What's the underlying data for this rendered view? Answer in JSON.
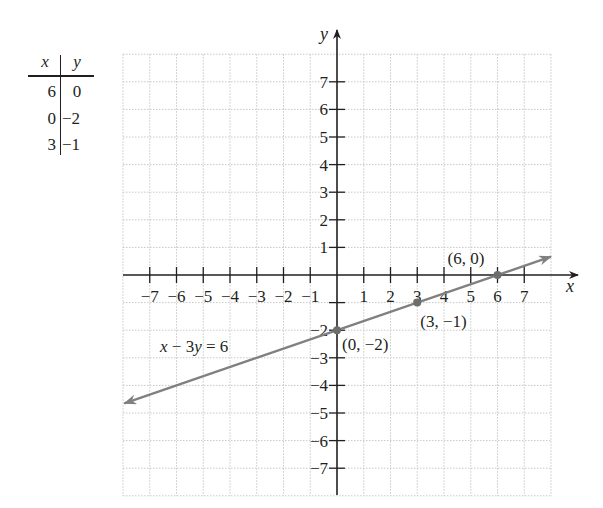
{
  "table": {
    "headers": [
      "x",
      "y"
    ],
    "rows": [
      [
        "6",
        "0"
      ],
      [
        "0",
        "−2"
      ],
      [
        "3",
        "−1"
      ]
    ]
  },
  "chart_data": {
    "type": "line",
    "title": "",
    "xlabel": "x",
    "ylabel": "y",
    "xlim": [
      -8,
      8
    ],
    "ylim": [
      -8,
      8
    ],
    "grid": true,
    "x_ticks": [
      -7,
      -6,
      -5,
      -4,
      -3,
      -2,
      -1,
      1,
      2,
      3,
      4,
      5,
      6,
      7
    ],
    "x_tick_labels": [
      "−7",
      "−6",
      "−5",
      "−4",
      "−3",
      "−2",
      "−1",
      "1",
      "2",
      "3",
      "4",
      "5",
      "6",
      "7"
    ],
    "y_ticks": [
      7,
      6,
      5,
      4,
      3,
      2,
      1,
      -1,
      -2,
      -3,
      -4,
      -5,
      -6,
      -7
    ],
    "y_tick_labels": [
      "7",
      "6",
      "5",
      "4",
      "3",
      "2",
      "1",
      "",
      "−2",
      "−3",
      "−4",
      "−5",
      "−6",
      "−7"
    ],
    "series": [
      {
        "name": "x − 3y = 6",
        "equation": "x − 3y = 6",
        "slope": 0.3333,
        "intercept": -2,
        "x_range": [
          -8,
          8
        ],
        "arrows": "both",
        "color": "#808080"
      }
    ],
    "points": [
      {
        "x": 6,
        "y": 0,
        "label": "(6, 0)"
      },
      {
        "x": 0,
        "y": -2,
        "label": "(0, −2)"
      },
      {
        "x": 3,
        "y": -1,
        "label": "(3, −1)"
      }
    ],
    "annotations": [
      {
        "text": "x − 3y = 6",
        "near": [
          -6,
          -3
        ]
      }
    ]
  },
  "colors": {
    "axis": "#231f20",
    "grid": "#c8c8c8",
    "line": "#808080",
    "point": "#6d6d6d"
  }
}
